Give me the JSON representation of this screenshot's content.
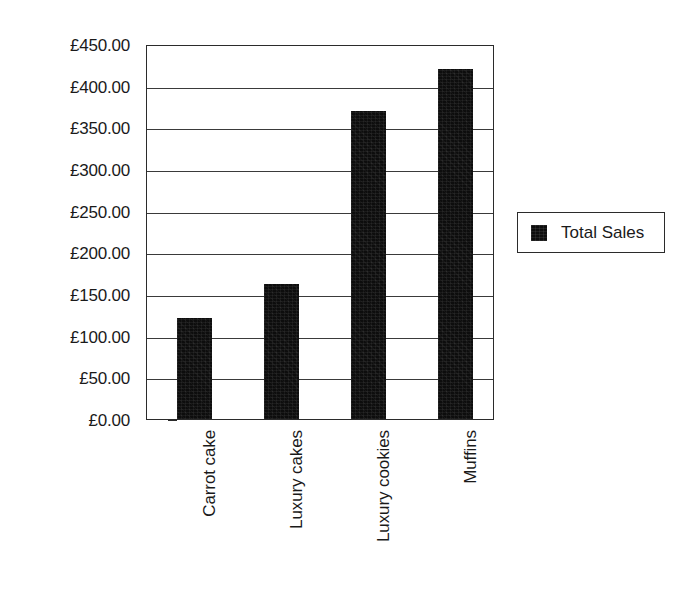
{
  "chart_data": {
    "type": "bar",
    "title": "",
    "subtitle": "",
    "xlabel": "",
    "ylabel": "",
    "categories": [
      "Carrot cake",
      "Luxury cakes",
      "Luxury cookies",
      "Muffins"
    ],
    "series": [
      {
        "name": "Total Sales",
        "values": [
          121,
          162,
          370,
          420
        ],
        "color": "#0d0d0d"
      }
    ],
    "ylim": [
      0,
      450
    ],
    "ytick_values": [
      0,
      50,
      100,
      150,
      200,
      250,
      300,
      350,
      400,
      450
    ],
    "ytick_labels": [
      "£0.00",
      "£50.00",
      "£100.00",
      "£150.00",
      "£200.00",
      "£250.00",
      "£300.00",
      "£350.00",
      "£400.00",
      "£450.00"
    ],
    "currency_symbol": "£",
    "grid": true,
    "grid_axis": "y",
    "legend_position": "right",
    "legend_entries": [
      "Total Sales"
    ],
    "category_label_rotation": -90,
    "annotations": []
  },
  "legend": {
    "label": "Total Sales"
  },
  "colors": {
    "bar": "#0d0d0d",
    "axis": "#2b2b2b",
    "grid": "#3a3a3a",
    "background": "#ffffff",
    "text": "#1a1a1a"
  }
}
